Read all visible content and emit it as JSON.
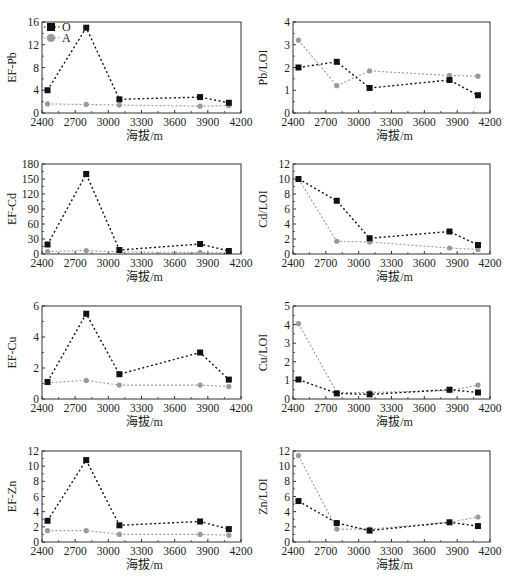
{
  "figure": {
    "legend": {
      "items": [
        {
          "label": "O",
          "marker": "square",
          "color": "#111111"
        },
        {
          "label": "A",
          "marker": "circle",
          "color": "#9a9a9a"
        }
      ]
    },
    "colors": {
      "O": "#111111",
      "A": "#9a9a9a",
      "frame": "#333333"
    }
  },
  "chart_data": [
    {
      "type": "line",
      "id": "ef-pb",
      "title": "",
      "xlabel": "海拔/m",
      "ylabel": "EF-Pb",
      "xlim": [
        2400,
        4200
      ],
      "ylim": [
        0,
        16
      ],
      "xticks": [
        2400,
        2700,
        3000,
        3300,
        3600,
        3900,
        4200
      ],
      "yticks": [
        0,
        4,
        8,
        12,
        16
      ],
      "grid": false,
      "legend_position": "upper-left",
      "x": [
        2450,
        2800,
        3100,
        3830,
        4090
      ],
      "series": [
        {
          "name": "O",
          "values": [
            4.0,
            15.0,
            2.4,
            2.8,
            1.8
          ]
        },
        {
          "name": "A",
          "values": [
            1.6,
            1.5,
            1.4,
            1.2,
            1.3
          ]
        }
      ]
    },
    {
      "type": "line",
      "id": "pb-loi",
      "title": "",
      "xlabel": "海拔/m",
      "ylabel": "Pb/LOI",
      "xlim": [
        2400,
        4200
      ],
      "ylim": [
        0,
        4
      ],
      "xticks": [
        2400,
        2700,
        3000,
        3300,
        3600,
        3900,
        4200
      ],
      "yticks": [
        0,
        1,
        2,
        3,
        4
      ],
      "grid": false,
      "x": [
        2450,
        2800,
        3100,
        3830,
        4090
      ],
      "series": [
        {
          "name": "O",
          "values": [
            2.0,
            2.25,
            1.1,
            1.45,
            0.78
          ]
        },
        {
          "name": "A",
          "values": [
            3.2,
            1.2,
            1.85,
            1.65,
            1.62
          ]
        }
      ]
    },
    {
      "type": "line",
      "id": "ef-cd",
      "title": "",
      "xlabel": "海拔/m",
      "ylabel": "EF-Cd",
      "xlim": [
        2400,
        4200
      ],
      "ylim": [
        0,
        180
      ],
      "xticks": [
        2400,
        2700,
        3000,
        3300,
        3600,
        3900,
        4200
      ],
      "yticks": [
        0,
        30,
        60,
        90,
        120,
        150,
        180
      ],
      "grid": false,
      "x": [
        2450,
        2800,
        3100,
        3830,
        4090
      ],
      "series": [
        {
          "name": "O",
          "values": [
            19,
            160,
            8,
            20,
            6
          ]
        },
        {
          "name": "A",
          "values": [
            5,
            7,
            4,
            3,
            3
          ]
        }
      ]
    },
    {
      "type": "line",
      "id": "cd-loi",
      "title": "",
      "xlabel": "海拔/m",
      "ylabel": "Cd/LOI",
      "xlim": [
        2400,
        4200
      ],
      "ylim": [
        0,
        12
      ],
      "xticks": [
        2400,
        2700,
        3000,
        3300,
        3600,
        3900,
        4200
      ],
      "yticks": [
        0,
        2,
        4,
        6,
        8,
        10,
        12
      ],
      "grid": false,
      "x": [
        2450,
        2800,
        3100,
        3830,
        4090
      ],
      "series": [
        {
          "name": "O",
          "values": [
            10.0,
            7.1,
            2.1,
            3.0,
            1.2
          ]
        },
        {
          "name": "A",
          "values": [
            10.0,
            1.7,
            1.6,
            0.8,
            0.6
          ]
        }
      ]
    },
    {
      "type": "line",
      "id": "ef-cu",
      "title": "",
      "xlabel": "海拔/m",
      "ylabel": "EF-Cu",
      "xlim": [
        2400,
        4200
      ],
      "ylim": [
        0,
        6
      ],
      "xticks": [
        2400,
        2700,
        3000,
        3300,
        3600,
        3900,
        4200
      ],
      "yticks": [
        0,
        2,
        4,
        6
      ],
      "grid": false,
      "x": [
        2450,
        2800,
        3100,
        3830,
        4090
      ],
      "series": [
        {
          "name": "O",
          "values": [
            1.1,
            5.5,
            1.6,
            3.0,
            1.25
          ]
        },
        {
          "name": "A",
          "values": [
            1.05,
            1.2,
            0.9,
            0.9,
            0.8
          ]
        }
      ]
    },
    {
      "type": "line",
      "id": "cu-loi",
      "title": "",
      "xlabel": "海拔/m",
      "ylabel": "Cu/LOI",
      "xlim": [
        2400,
        4200
      ],
      "ylim": [
        0,
        5
      ],
      "xticks": [
        2400,
        2700,
        3000,
        3300,
        3600,
        3900,
        4200
      ],
      "yticks": [
        0,
        1,
        2,
        3,
        4,
        5
      ],
      "grid": false,
      "x": [
        2450,
        2800,
        3100,
        3830,
        4090
      ],
      "series": [
        {
          "name": "O",
          "values": [
            1.05,
            0.3,
            0.25,
            0.5,
            0.35
          ]
        },
        {
          "name": "A",
          "values": [
            4.05,
            0.35,
            0.35,
            0.45,
            0.75
          ]
        }
      ]
    },
    {
      "type": "line",
      "id": "ef-zn",
      "title": "",
      "xlabel": "海拔/m",
      "ylabel": "EF-Zn",
      "xlim": [
        2400,
        4200
      ],
      "ylim": [
        0,
        12
      ],
      "xticks": [
        2400,
        2700,
        3000,
        3300,
        3600,
        3900,
        4200
      ],
      "yticks": [
        0,
        2,
        4,
        6,
        8,
        10,
        12
      ],
      "grid": false,
      "x": [
        2450,
        2800,
        3100,
        3830,
        4090
      ],
      "series": [
        {
          "name": "O",
          "values": [
            2.8,
            10.8,
            2.2,
            2.7,
            1.7
          ]
        },
        {
          "name": "A",
          "values": [
            1.5,
            1.5,
            1.0,
            1.0,
            0.9
          ]
        }
      ]
    },
    {
      "type": "line",
      "id": "zn-loi",
      "title": "",
      "xlabel": "海拔/m",
      "ylabel": "Zn/LOI",
      "xlim": [
        2400,
        4200
      ],
      "ylim": [
        0,
        12
      ],
      "xticks": [
        2400,
        2700,
        3000,
        3300,
        3600,
        3900,
        4200
      ],
      "yticks": [
        0,
        2,
        4,
        6,
        8,
        10,
        12
      ],
      "grid": false,
      "x": [
        2450,
        2800,
        3100,
        3830,
        4090
      ],
      "series": [
        {
          "name": "O",
          "values": [
            5.4,
            2.5,
            1.5,
            2.6,
            2.1
          ]
        },
        {
          "name": "A",
          "values": [
            11.4,
            1.7,
            1.7,
            2.6,
            3.3
          ]
        }
      ]
    }
  ]
}
